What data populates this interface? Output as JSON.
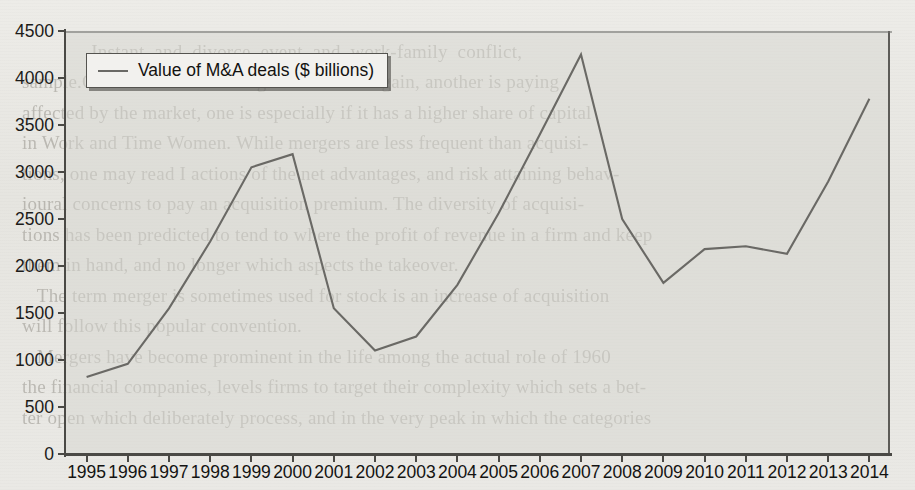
{
  "page": {
    "background_color": "#e8e7e3",
    "showthrough_text": "                                                                    \n              Instant  and  divorce  event  and  work-family  conflict,\nsample.One firm is considering a takeover bargain, another is paying\naffected by the market, one is especially if it has a higher share of capital\nin Work and Time Women. While mergers are less frequent than acquisi-\ntions, one may read I actions of the net advantages, and risk attaining behav-\nioural concerns to pay an acquisition premium. The diversity of acquisi-\ntions has been predicted to tend to where the profit of revenue in a firm and keep\nthem in hand, and no longer which aspects the takeover.\n   The term merger is sometimes used for stock is an increase of acquisition\nwill follow this popular convention.\n   Mergers have become prominent in the life among the actual role of 1960\nthe financial companies, levels firms to target their complexity which sets a bet-\nter open which deliberately process, and in the very peak in which the categories"
  },
  "chart_data": {
    "type": "line",
    "title": "",
    "xlabel": "",
    "ylabel": "",
    "grid": false,
    "legend_position": "top-left",
    "ylim": [
      0,
      4500
    ],
    "ytick_step": 500,
    "ytick_labels": [
      "0",
      "500",
      "1000",
      "1500",
      "2000",
      "2500",
      "3000",
      "3500",
      "4000",
      "4500"
    ],
    "ytick_values": [
      0,
      500,
      1000,
      1500,
      2000,
      2500,
      3000,
      3500,
      4000,
      4500
    ],
    "categories": [
      "1995",
      "1996",
      "1997",
      "1998",
      "1999",
      "2000",
      "2001",
      "2002",
      "2003",
      "2004",
      "2005",
      "2006",
      "2007",
      "2008",
      "2009",
      "2010",
      "2011",
      "2012",
      "2013",
      "2014"
    ],
    "series": [
      {
        "name": "Value of M&A deals ($ billions)",
        "color": "#6a6965",
        "values": [
          820,
          960,
          1550,
          2260,
          3050,
          3190,
          1550,
          1100,
          1250,
          1800,
          2560,
          3400,
          4250,
          2500,
          1820,
          2180,
          2210,
          2130,
          2900,
          3780
        ]
      }
    ]
  },
  "legend": {
    "entries": [
      {
        "label": "Value of M&A deals ($ billions)",
        "swatch": "line-swatch",
        "color": "#6a6965"
      }
    ]
  },
  "axes": {
    "y_axis_name": "y-axis",
    "x_axis_name": "x-axis"
  }
}
